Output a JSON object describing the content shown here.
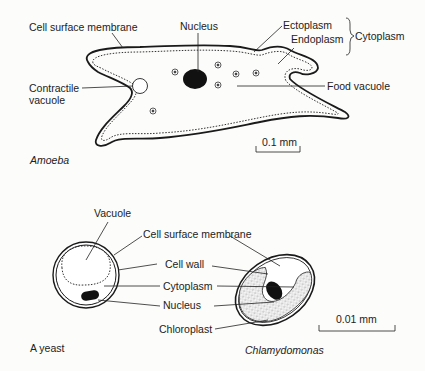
{
  "amoeba": {
    "caption": "Amoeba",
    "labels": {
      "cell_surface_membrane": "Cell surface membrane",
      "nucleus": "Nucleus",
      "ectoplasm": "Ectoplasm",
      "endoplasm": "Endoplasm",
      "cytoplasm": "Cytoplasm",
      "contractile_vacuole_1": "Contractile",
      "contractile_vacuole_2": "vacuole",
      "food_vacuole": "Food vacuole"
    },
    "scale_bar": "0.1 mm"
  },
  "yeast": {
    "caption": "A yeast",
    "labels": {
      "vacuole": "Vacuole",
      "cell_surface_membrane": "Cell surface membrane",
      "cell_wall": "Cell wall",
      "cytoplasm": "Cytoplasm",
      "nucleus": "Nucleus",
      "chloroplast": "Chloroplast"
    }
  },
  "chlamydomonas": {
    "caption": "Chlamydomonas",
    "scale_bar": "0.01 mm"
  },
  "colors": {
    "ink": "#1a1a1a",
    "paper": "#fcfcfb"
  }
}
